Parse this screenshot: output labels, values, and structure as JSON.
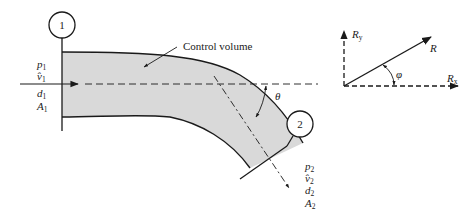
{
  "figure": {
    "type": "pipe-bend control volume diagram",
    "colors": {
      "stroke": "#1a1a1a",
      "fill": "#d9d9d9",
      "background": "#ffffff"
    },
    "control_volume_label": "Control volume",
    "section1": {
      "number": "1",
      "vars": [
        {
          "sym": "p",
          "sub": "1"
        },
        {
          "sym": "v̂",
          "sub": "1"
        },
        {
          "sym": "d",
          "sub": "1"
        },
        {
          "sym": "A",
          "sub": "1"
        }
      ]
    },
    "section2": {
      "number": "2",
      "vars": [
        {
          "sym": "p",
          "sub": "2"
        },
        {
          "sym": "v̂",
          "sub": "2"
        },
        {
          "sym": "d",
          "sub": "2"
        },
        {
          "sym": "A",
          "sub": "2"
        }
      ]
    },
    "angle_bend": "θ",
    "force_diagram": {
      "resultant": "R",
      "x_component": {
        "sym": "R",
        "sub": "x"
      },
      "y_component": {
        "sym": "R",
        "sub": "y"
      },
      "angle": "φ"
    }
  }
}
